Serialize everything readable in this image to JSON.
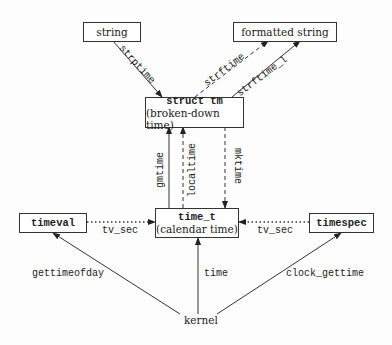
{
  "nodes": {
    "string": "string",
    "formatted_string": "formatted string",
    "struct_tm_title": "struct tm",
    "struct_tm_sub": "(broken-down time)",
    "time_t_title": "time_t",
    "time_t_sub": "(calendar time)",
    "timeval": "timeval",
    "timespec": "timespec",
    "kernel": "kernel"
  },
  "edges": {
    "strptime": "strptime",
    "strftime": "strftime",
    "strftime_l": "strftime_l",
    "gmtime": "gmtime",
    "localtime": "localtime",
    "mktime": "mktime",
    "tv_sec_left": "tv_sec",
    "tv_sec_right": "tv_sec",
    "gettimeofday": "gettimeofday",
    "time": "time",
    "clock_gettime": "clock_gettime"
  }
}
